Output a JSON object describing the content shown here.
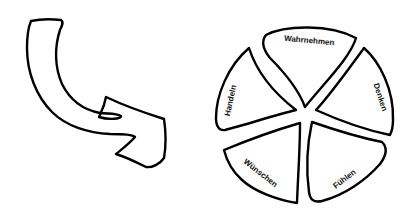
{
  "diagram": {
    "arrow": {
      "icon": "curved-arrow-icon",
      "direction": "down-right"
    },
    "circle": {
      "segments": [
        {
          "id": "wahrnehmen",
          "label": "Wahrnehmen"
        },
        {
          "id": "denken",
          "label": "Denken"
        },
        {
          "id": "fuehlen",
          "label": "Fühlen"
        },
        {
          "id": "wuenschen",
          "label": "Wünschen"
        },
        {
          "id": "handeln",
          "label": "Handeln"
        }
      ]
    },
    "colors": {
      "stroke": "#000000",
      "fill": "#ffffff",
      "text": "#111111"
    }
  }
}
